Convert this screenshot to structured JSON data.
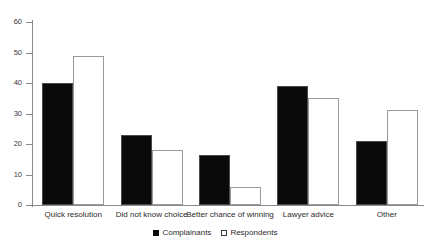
{
  "chart_data": {
    "type": "bar",
    "title": "",
    "subtitle": "",
    "xlabel": "",
    "ylabel": "",
    "ylim": [
      0,
      60
    ],
    "yticks": [
      0,
      10,
      20,
      30,
      40,
      50,
      60
    ],
    "ytick_labels": [
      "0",
      "10",
      "20",
      "30",
      "40",
      "50",
      "60"
    ],
    "grid": false,
    "legend_position": "bottom-center",
    "categories": [
      "Quick resolution",
      "Did not know choice",
      "Better chance of winning",
      "Lawyer advice",
      "Other"
    ],
    "series": [
      {
        "name": "Complainants",
        "color": "#0a0a0a",
        "fill": "solid-black",
        "values": [
          40,
          23,
          16.5,
          39,
          21
        ]
      },
      {
        "name": "Respondents",
        "color": "#ffffff",
        "fill": "dotted-stipple",
        "values": [
          49,
          18,
          6,
          35,
          31
        ]
      }
    ]
  },
  "legend": {
    "entries": [
      {
        "label": "Complainants",
        "marker": "filled-square-icon"
      },
      {
        "label": "Respondents",
        "marker": "hollow-square-icon"
      }
    ]
  }
}
